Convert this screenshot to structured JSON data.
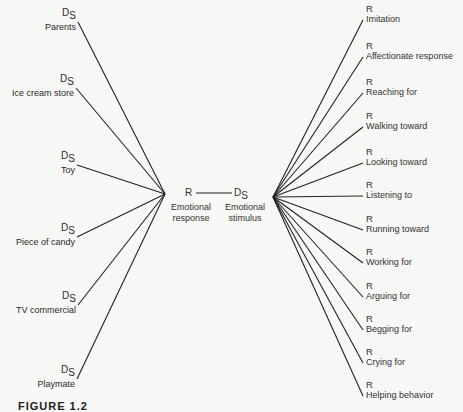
{
  "diagram": {
    "type": "stimulus-response fan diagram",
    "left_nodes": [
      {
        "symbol": "D",
        "subscript": "S",
        "label": "Parents"
      },
      {
        "symbol": "D",
        "subscript": "S",
        "label": "Ice cream store"
      },
      {
        "symbol": "D",
        "subscript": "S",
        "label": "Toy"
      },
      {
        "symbol": "D",
        "subscript": "S",
        "label": "Piece of candy"
      },
      {
        "symbol": "D",
        "subscript": "S",
        "label": "TV commercial"
      },
      {
        "symbol": "D",
        "subscript": "S",
        "label": "Playmate"
      }
    ],
    "center": {
      "response_symbol": "R",
      "response_label_line1": "Emotional",
      "response_label_line2": "response",
      "stimulus_symbol": "D",
      "stimulus_subscript": "S",
      "stimulus_label_line1": "Emotional",
      "stimulus_label_line2": "stimulus"
    },
    "right_nodes": [
      {
        "symbol": "R",
        "label": "Imitation"
      },
      {
        "symbol": "R",
        "label": "Affectionate response"
      },
      {
        "symbol": "R",
        "label": "Reaching for"
      },
      {
        "symbol": "R",
        "label": "Walking toward"
      },
      {
        "symbol": "R",
        "label": "Looking toward"
      },
      {
        "symbol": "R",
        "label": "Listening to"
      },
      {
        "symbol": "R",
        "label": "Running toward"
      },
      {
        "symbol": "R",
        "label": "Working for"
      },
      {
        "symbol": "R",
        "label": "Arguing for"
      },
      {
        "symbol": "R",
        "label": "Begging for"
      },
      {
        "symbol": "R",
        "label": "Crying for"
      },
      {
        "symbol": "R",
        "label": "Helping behavior"
      }
    ],
    "caption": "FIGURE 1.2"
  }
}
